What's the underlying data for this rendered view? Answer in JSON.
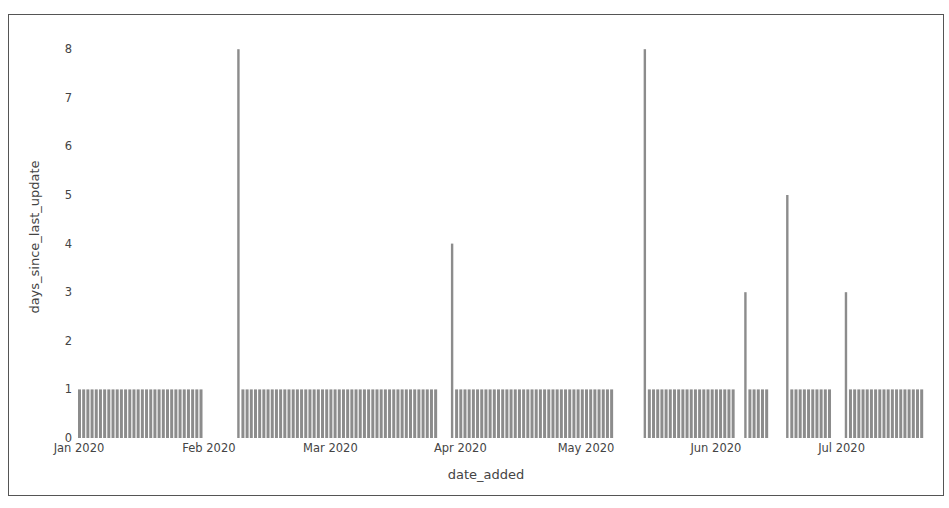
{
  "chart_data": {
    "type": "bar",
    "title": "",
    "xlabel": "date_added",
    "ylabel": "days_since_last_update",
    "ylim": [
      0,
      8
    ],
    "yticks": [
      0,
      1,
      2,
      3,
      4,
      5,
      6,
      7,
      8
    ],
    "xtick_labels": [
      "Jan 2020",
      "Feb 2020",
      "Mar 2020",
      "Apr 2020",
      "May 2020",
      "Jun 2020",
      "Jul 2020"
    ],
    "xtick_day_offsets": [
      0,
      31,
      60,
      91,
      121,
      152,
      182
    ],
    "x_start": "2020-01-01",
    "grid": false,
    "legend": null,
    "bar_color": "#8c8c8c",
    "segments": [
      {
        "start_day": 0,
        "end_day": 29,
        "value": 1
      },
      {
        "start_day": 38,
        "end_day": 38,
        "value": 8
      },
      {
        "start_day": 39,
        "end_day": 85,
        "value": 1
      },
      {
        "start_day": 89,
        "end_day": 89,
        "value": 4
      },
      {
        "start_day": 90,
        "end_day": 127,
        "value": 1
      },
      {
        "start_day": 135,
        "end_day": 135,
        "value": 8
      },
      {
        "start_day": 136,
        "end_day": 156,
        "value": 1
      },
      {
        "start_day": 159,
        "end_day": 159,
        "value": 3
      },
      {
        "start_day": 160,
        "end_day": 164,
        "value": 1
      },
      {
        "start_day": 169,
        "end_day": 169,
        "value": 5
      },
      {
        "start_day": 170,
        "end_day": 179,
        "value": 1
      },
      {
        "start_day": 183,
        "end_day": 183,
        "value": 3
      },
      {
        "start_day": 184,
        "end_day": 201,
        "value": 1
      }
    ]
  }
}
